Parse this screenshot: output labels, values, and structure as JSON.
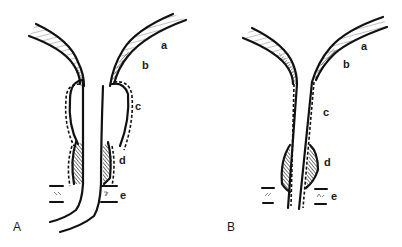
{
  "figure": {
    "panels": [
      {
        "id": "A",
        "label": "A",
        "layer_labels": {
          "a": "a",
          "b": "b",
          "c": "c",
          "d": "d",
          "e": "e"
        }
      },
      {
        "id": "B",
        "label": "B",
        "layer_labels": {
          "a": "a",
          "b": "b",
          "c": "c",
          "d": "d",
          "e": "e"
        }
      }
    ]
  }
}
